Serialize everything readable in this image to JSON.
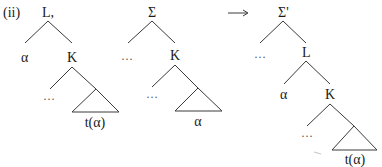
{
  "example_label": "(ii)",
  "arrow": "⟶",
  "trees": [
    {
      "id": "tree-1",
      "root": "L,",
      "left_daughter": "α",
      "right_daughter": "K",
      "k_left": "…",
      "triangle_label": "t(α)"
    },
    {
      "id": "tree-2",
      "root": "Σ",
      "left_daughter": "…",
      "right_daughter": "K",
      "k_left": "…",
      "triangle_label": "α"
    },
    {
      "id": "tree-3",
      "root": "Σ'",
      "left_daughter": "…",
      "right_daughter": "L",
      "l_left": "α",
      "l_right": "K",
      "k_left": "…",
      "triangle_label": "t(α)"
    }
  ],
  "colors": {
    "line": "#3a3a3a",
    "text": "#1a1a1a",
    "background": "#ffffff"
  }
}
